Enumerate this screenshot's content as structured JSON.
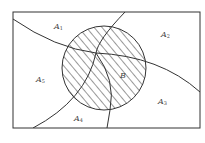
{
  "diagram": {
    "type": "venn-partition",
    "colors": {
      "stroke": "#333333",
      "hatch": "#333333",
      "background": "#ffffff"
    },
    "regions": [
      {
        "id": "A1",
        "base": "A",
        "sub": "1"
      },
      {
        "id": "A2",
        "base": "A",
        "sub": "2"
      },
      {
        "id": "A3",
        "base": "A",
        "sub": "3"
      },
      {
        "id": "A4",
        "base": "A",
        "sub": "4"
      },
      {
        "id": "A5",
        "base": "A",
        "sub": "5"
      }
    ],
    "event": {
      "id": "B",
      "label": "B",
      "shaded": true,
      "pattern": "diagonal-hatch"
    }
  }
}
